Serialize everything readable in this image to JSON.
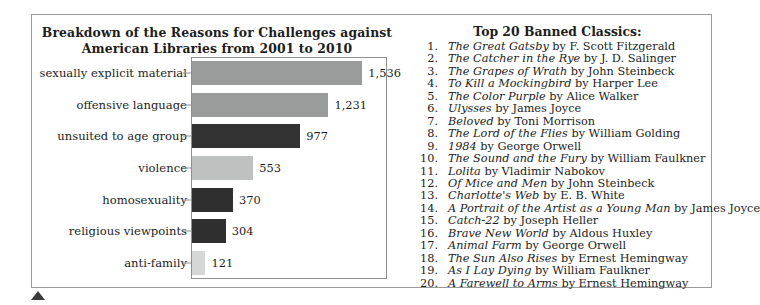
{
  "figure": {
    "background_color": "#ffffff",
    "frame_color": "#9a9a9a"
  },
  "chart_data": {
    "type": "bar",
    "orientation": "horizontal",
    "title": "Breakdown of the Reasons for Challenges against American Libraries from 2001 to 2010",
    "title_line1": "Breakdown of the Reasons for Challenges against",
    "title_line2": "American Libraries from 2001 to 2010",
    "xlabel": "",
    "ylabel": "",
    "grid": false,
    "legend": "none",
    "xlim": [
      0,
      1750
    ],
    "categories": [
      "sexually explicit material",
      "offensive language",
      "unsuited to age group",
      "violence",
      "homosexuality",
      "religious viewpoints",
      "anti-family"
    ],
    "values": [
      1536,
      1231,
      977,
      553,
      370,
      304,
      121
    ],
    "value_labels": [
      "1,536",
      "1,231",
      "977",
      "553",
      "370",
      "304",
      "121"
    ],
    "bar_colors": [
      "#9a9b9b",
      "#9a9b9b",
      "#333333",
      "#bfc0c0",
      "#2f2f2f",
      "#2f2f2f",
      "#d5d6d6"
    ]
  },
  "book_list": {
    "title": "Top 20 Banned Classics:",
    "items": [
      {
        "num": "1.",
        "title": "The Great Gatsby",
        "author": " by F. Scott Fitzgerald"
      },
      {
        "num": "2.",
        "title": "The Catcher in the Rye",
        "author": " by J. D. Salinger"
      },
      {
        "num": "3.",
        "title": "The Grapes of Wrath",
        "author": " by John Steinbeck"
      },
      {
        "num": "4.",
        "title": "To Kill a Mockingbird",
        "author": " by Harper Lee"
      },
      {
        "num": "5.",
        "title": "The Color Purple",
        "author": " by Alice Walker"
      },
      {
        "num": "6.",
        "title": "Ulysses",
        "author": " by James Joyce"
      },
      {
        "num": "7.",
        "title": "Beloved",
        "author": " by Toni Morrison"
      },
      {
        "num": "8.",
        "title": "The Lord of the Flies",
        "author": " by William Golding"
      },
      {
        "num": "9.",
        "title": "1984",
        "author": " by George Orwell"
      },
      {
        "num": "10.",
        "title": "The Sound and the Fury",
        "author": " by William Faulkner"
      },
      {
        "num": "11.",
        "title": "Lolita",
        "author": " by Vladimir Nabokov"
      },
      {
        "num": "12.",
        "title": "Of Mice and Men",
        "author": " by John Steinbeck"
      },
      {
        "num": "13.",
        "title": "Charlotte's Web",
        "author": " by E. B. White"
      },
      {
        "num": "14.",
        "title": "A Portrait of the Artist as a Young Man",
        "author": " by James Joyce"
      },
      {
        "num": "15.",
        "title": "Catch-22",
        "author": " by Joseph Heller"
      },
      {
        "num": "16.",
        "title": "Brave New World",
        "author": " by Aldous Huxley"
      },
      {
        "num": "17.",
        "title": "Animal Farm",
        "author": " by George Orwell"
      },
      {
        "num": "18.",
        "title": "The Sun Also Rises",
        "author": " by Ernest Hemingway"
      },
      {
        "num": "19.",
        "title": "As I Lay Dying",
        "author": " by William Faulkner"
      },
      {
        "num": "20.",
        "title": "A Farewell to Arms",
        "author": " by Ernest Hemingway"
      }
    ]
  }
}
